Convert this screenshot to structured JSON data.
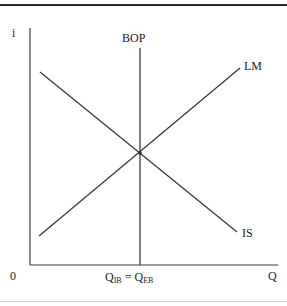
{
  "figure": {
    "type": "economics-diagram",
    "name": "IS-LM-BOP internal and external balance diagram",
    "background_color": "#ffffff",
    "line_color": "#3a3a3a",
    "text_color": "#1a1a1a",
    "top_rule_color": "#2b2b2b",
    "bottom_rule_color": "#d8d8d8"
  },
  "axes": {
    "y_label": "i",
    "x_label": "Q",
    "origin_label": "0",
    "x_axis": {
      "x1": 30,
      "y1": 265,
      "x2": 278,
      "y2": 265
    },
    "y_axis": {
      "x1": 30,
      "y1": 28,
      "x2": 30,
      "y2": 265
    }
  },
  "curves": [
    {
      "id": "bop",
      "label": "BOP",
      "shape": "vertical",
      "x1": 140,
      "y1": 48,
      "x2": 140,
      "y2": 265,
      "label_x": 122,
      "label_y": 32
    },
    {
      "id": "lm",
      "label": "LM",
      "shape": "upward-sloping",
      "x1": 39,
      "y1": 236,
      "x2": 240,
      "y2": 68,
      "label_x": 244,
      "label_y": 60
    },
    {
      "id": "is",
      "label": "IS",
      "shape": "downward-sloping",
      "x1": 40,
      "y1": 72,
      "x2": 237,
      "y2": 232,
      "label_x": 242,
      "label_y": 227
    }
  ],
  "equilibrium": {
    "point_x": 140,
    "point_y": 153,
    "x_axis_annotation": "Q_IB = Q_EB",
    "annotation_parts": {
      "first_symbol": "Q",
      "first_subscript": "IB",
      "operator": "=",
      "second_symbol": "Q",
      "second_subscript": "EB"
    }
  },
  "icons": {
    "intersection": "intersection-point-marker"
  }
}
